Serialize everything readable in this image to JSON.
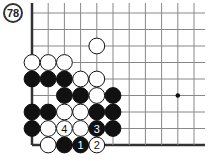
{
  "diagram": {
    "number": "78",
    "board": {
      "cols": 11,
      "rows": 9,
      "origin_x": 32,
      "origin_y": 13,
      "spacing_x": 16.2,
      "spacing_y": 16.5,
      "left_edge": true,
      "bottom_edge": true,
      "top_open": true,
      "right_open": true,
      "line_color": "#888888",
      "edge_color": "#333333"
    },
    "star_points": [
      {
        "c": 9,
        "r": 5
      }
    ],
    "stones": [
      {
        "c": 4,
        "r": 2,
        "color": "white"
      },
      {
        "c": 0,
        "r": 3,
        "color": "white"
      },
      {
        "c": 1,
        "r": 3,
        "color": "white"
      },
      {
        "c": 2,
        "r": 3,
        "color": "white"
      },
      {
        "c": 0,
        "r": 4,
        "color": "black"
      },
      {
        "c": 1,
        "r": 4,
        "color": "black"
      },
      {
        "c": 2,
        "r": 4,
        "color": "black"
      },
      {
        "c": 3,
        "r": 4,
        "color": "white"
      },
      {
        "c": 4,
        "r": 4,
        "color": "white"
      },
      {
        "c": 2,
        "r": 5,
        "color": "black"
      },
      {
        "c": 3,
        "r": 5,
        "color": "black"
      },
      {
        "c": 4,
        "r": 5,
        "color": "white"
      },
      {
        "c": 5,
        "r": 5,
        "color": "black"
      },
      {
        "c": 0,
        "r": 6,
        "color": "black"
      },
      {
        "c": 1,
        "r": 6,
        "color": "black"
      },
      {
        "c": 2,
        "r": 6,
        "color": "white"
      },
      {
        "c": 3,
        "r": 6,
        "color": "white"
      },
      {
        "c": 4,
        "r": 6,
        "color": "black"
      },
      {
        "c": 5,
        "r": 6,
        "color": "black"
      },
      {
        "c": 0,
        "r": 7,
        "color": "black"
      },
      {
        "c": 1,
        "r": 7,
        "color": "white"
      },
      {
        "c": 2,
        "r": 7,
        "color": "white",
        "label": "4"
      },
      {
        "c": 3,
        "r": 7,
        "color": "white"
      },
      {
        "c": 4,
        "r": 7,
        "color": "black",
        "label": "3"
      },
      {
        "c": 5,
        "r": 7,
        "color": "black"
      },
      {
        "c": 1,
        "r": 8,
        "color": "white"
      },
      {
        "c": 2,
        "r": 8,
        "color": "black"
      },
      {
        "c": 3,
        "r": 8,
        "color": "black",
        "label": "1"
      },
      {
        "c": 4,
        "r": 8,
        "color": "white",
        "label": "2"
      }
    ]
  }
}
